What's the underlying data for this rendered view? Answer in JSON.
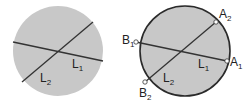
{
  "colors": {
    "disk_fill": "#c8c8c8",
    "line": "#333333",
    "outline": "#2a2a2a",
    "point_fill": "#ffffff",
    "text": "#222222"
  },
  "left_figure": {
    "lines": [
      {
        "name": "L",
        "sub": "1"
      },
      {
        "name": "L",
        "sub": "2"
      }
    ]
  },
  "right_figure": {
    "lines": [
      {
        "name": "L",
        "sub": "1"
      },
      {
        "name": "L",
        "sub": "2"
      }
    ],
    "points": [
      {
        "name": "A",
        "sub": "1"
      },
      {
        "name": "A",
        "sub": "2"
      },
      {
        "name": "B",
        "sub": "1"
      },
      {
        "name": "B",
        "sub": "2"
      }
    ]
  }
}
